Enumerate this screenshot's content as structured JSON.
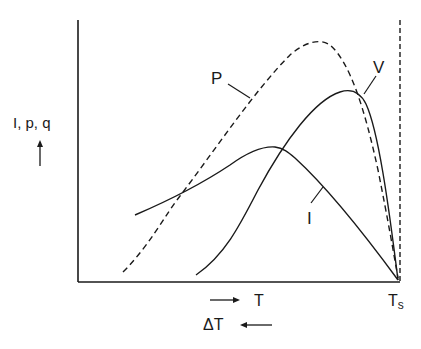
{
  "diagram": {
    "y_axis_label": "I, p, q",
    "x_axis_label": "T",
    "x_axis_end_label": "T",
    "x_axis_end_subscript": "s",
    "delta_label": "ΔT",
    "curves": [
      {
        "name": "P",
        "label": "P",
        "style": "dashed"
      },
      {
        "name": "V",
        "label": "V",
        "style": "solid"
      },
      {
        "name": "I",
        "label": "I",
        "style": "solid"
      }
    ],
    "colors": {
      "ink": "#1a1a1a",
      "background": "#ffffff"
    }
  }
}
